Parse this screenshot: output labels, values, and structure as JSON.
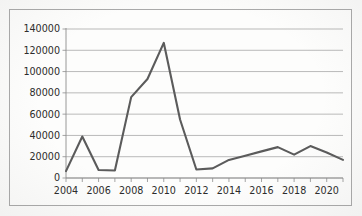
{
  "chart_data": {
    "type": "line",
    "title": "",
    "subtitle": "",
    "xlabel": "",
    "ylabel": "",
    "grid": true,
    "legend": false,
    "legend_position": "none",
    "xlim": [
      2004,
      2021
    ],
    "ylim": [
      0,
      140000
    ],
    "ytick_step": 20000,
    "yticks": [
      0,
      20000,
      40000,
      60000,
      80000,
      100000,
      120000,
      140000
    ],
    "ytick_labels": [
      "0",
      "20000",
      "40000",
      "60000",
      "80000",
      "100000",
      "120000",
      "140000"
    ],
    "xticks": [
      2004,
      2005,
      2006,
      2007,
      2008,
      2009,
      2010,
      2011,
      2012,
      2013,
      2014,
      2015,
      2016,
      2017,
      2018,
      2019,
      2020,
      2021
    ],
    "xtick_labels_shown": [
      "2004",
      "2006",
      "2008",
      "2010",
      "2012",
      "2014",
      "2016",
      "2018",
      "2020"
    ],
    "x": [
      2004,
      2005,
      2006,
      2007,
      2008,
      2009,
      2010,
      2011,
      2012,
      2013,
      2014,
      2015,
      2016,
      2017,
      2018,
      2019,
      2020,
      2021
    ],
    "values": [
      6500,
      39000,
      7500,
      7000,
      76000,
      93000,
      127000,
      55000,
      8000,
      9000,
      17000,
      21000,
      25000,
      29000,
      22000,
      30000,
      24000,
      17000
    ],
    "series": [
      {
        "name": "Series 1",
        "color": "#5b5b5b",
        "values": [
          6500,
          39000,
          7500,
          7000,
          76000,
          93000,
          127000,
          55000,
          8000,
          9000,
          17000,
          21000,
          25000,
          29000,
          22000,
          30000,
          24000,
          17000
        ]
      }
    ],
    "annotations": []
  },
  "figure": {
    "frame_color": "#a9a9a9",
    "gridline_color": "#9c9c9c",
    "axis_color": "#8d8d8d",
    "line_color": "#5b5b5b",
    "background_color": "#fdfdfc"
  }
}
